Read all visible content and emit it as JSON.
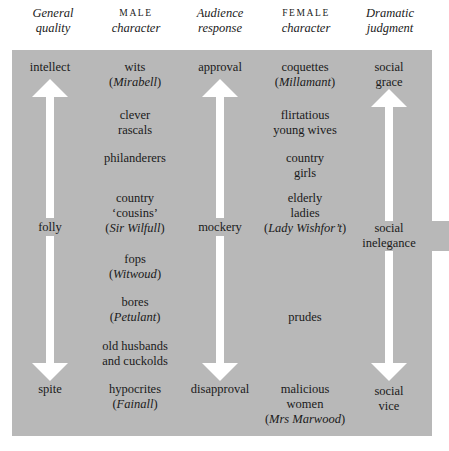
{
  "headers": [
    {
      "line1": "General",
      "line2": "quality",
      "style1": "italic"
    },
    {
      "line1": "MALE",
      "line2": "character",
      "style1": "smallcaps"
    },
    {
      "line1": "Audience",
      "line2": "response",
      "style1": "italic"
    },
    {
      "line1": "FEMALE",
      "line2": "character",
      "style1": "smallcaps"
    },
    {
      "line1": "Dramatic",
      "line2": "judgment",
      "style1": "italic"
    }
  ],
  "general_quality": {
    "top": "intellect",
    "middle": "folly",
    "bottom": "spite"
  },
  "audience_response": {
    "top": "approval",
    "middle": "mockery",
    "bottom": "disapproval"
  },
  "dramatic_judgment": {
    "top": [
      "social",
      "grace"
    ],
    "middle": [
      "social",
      "inelegance"
    ],
    "bottom": [
      "social",
      "vice"
    ]
  },
  "male_characters": [
    {
      "lines": [
        "wits"
      ],
      "example": "Mirabell"
    },
    {
      "lines": [
        "clever",
        "rascals"
      ],
      "example": null
    },
    {
      "lines": [
        "philanderers"
      ],
      "example": null
    },
    {
      "lines": [
        "country",
        "‘cousins’"
      ],
      "example": "Sir Wilfull"
    },
    {
      "lines": [
        "fops"
      ],
      "example": "Witwoud"
    },
    {
      "lines": [
        "bores"
      ],
      "example": "Petulant"
    },
    {
      "lines": [
        "old husbands",
        "and cuckolds"
      ],
      "example": null
    },
    {
      "lines": [
        "hypocrites"
      ],
      "example": "Fainall"
    }
  ],
  "female_characters": [
    {
      "lines": [
        "coquettes"
      ],
      "example": "Millamant"
    },
    {
      "lines": [
        "flirtatious",
        "young wives"
      ],
      "example": null
    },
    {
      "lines": [
        "country",
        "girls"
      ],
      "example": null
    },
    {
      "lines": [
        "elderly",
        "ladies"
      ],
      "example": "Lady Wishfor’t"
    },
    {
      "lines": [
        "prudes"
      ],
      "example": null
    },
    {
      "lines": [
        "malicious",
        "women"
      ],
      "example": "Mrs Marwood"
    }
  ],
  "colors": {
    "panel": "#b8b8b8",
    "arrow": "#ffffff",
    "text": "#1a1a1a"
  }
}
